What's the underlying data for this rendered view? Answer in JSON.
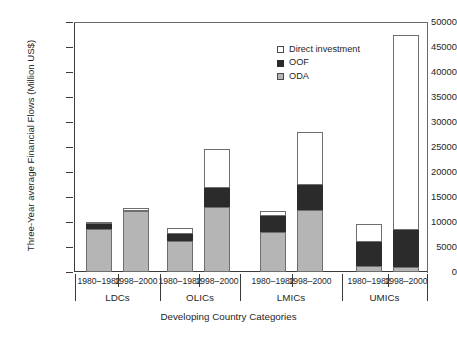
{
  "chart_data": {
    "type": "bar",
    "subtype": "stacked-bar-grouped",
    "title": "",
    "xlabel": "Developing Country Categories",
    "ylabel": "Three-Year average Financial Flows (Million US$)",
    "ylim": [
      0,
      50000
    ],
    "ytick_step": 5000,
    "yticks": [
      0,
      5000,
      10000,
      15000,
      20000,
      25000,
      30000,
      35000,
      40000,
      45000,
      50000
    ],
    "ytick_labels": [
      "0",
      "5000",
      "10000",
      "15000",
      "20000",
      "25000",
      "30000",
      "35000",
      "40000",
      "45000",
      "50000"
    ],
    "grid": false,
    "legend_position": "upper-right-inside",
    "groups": [
      "LDCs",
      "OLICs",
      "LMICs",
      "UMICs"
    ],
    "periods": [
      "1980–1982",
      "1998–2000"
    ],
    "categories": [
      "LDCs 1980–1982",
      "LDCs 1998–2000",
      "OLICs 1980–1982",
      "OLICs 1998–2000",
      "LMICs 1980–1982",
      "LMICs 1998–2000",
      "UMICs 1980–1982",
      "UMICs 1998–2000"
    ],
    "series": [
      {
        "name": "ODA",
        "color": "#b5b5b5",
        "values": [
          8700,
          12200,
          6200,
          13000,
          8000,
          12500,
          1200,
          1100
        ]
      },
      {
        "name": "OOF",
        "color": "#2b2b2b",
        "values": [
          900,
          0,
          1500,
          3800,
          3300,
          5000,
          4800,
          7400
        ]
      },
      {
        "name": "Direct investment",
        "color": "#ffffff",
        "values": [
          400,
          700,
          1200,
          7900,
          900,
          10500,
          3600,
          39000
        ]
      }
    ],
    "totals": [
      10000,
      12900,
      8900,
      24700,
      12200,
      28000,
      9600,
      47500
    ]
  },
  "legend": {
    "entries": [
      {
        "label": "Direct investment",
        "swatch": "open-square-white"
      },
      {
        "label": "OOF",
        "swatch": "filled-square-black"
      },
      {
        "label": "ODA",
        "swatch": "filled-square-gray"
      }
    ]
  }
}
